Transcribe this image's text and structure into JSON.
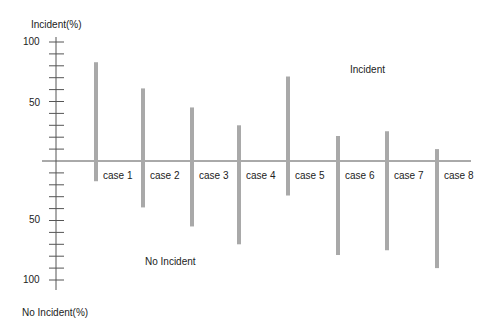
{
  "chart_data": {
    "type": "bar",
    "subtype": "diverging-vertical-lines",
    "title": "",
    "ylabel_top": "Incident(%)",
    "ylabel_bottom": "No Incident(%)",
    "region_label_top": "Incident",
    "region_label_bottom": "No Incident",
    "categories": [
      "case 1",
      "case 2",
      "case 3",
      "case 4",
      "case 5",
      "case 6",
      "case 7",
      "case 8"
    ],
    "series": [
      {
        "name": "Incident",
        "direction": "up",
        "values": [
          83,
          61,
          45,
          30,
          71,
          21,
          25,
          10
        ]
      },
      {
        "name": "No Incident",
        "direction": "down",
        "values": [
          17,
          39,
          55,
          70,
          29,
          79,
          75,
          90
        ]
      }
    ],
    "y_ticks_top": [
      "100",
      "50"
    ],
    "y_ticks_bottom": [
      "50",
      "100"
    ],
    "ylim_top": [
      0,
      100
    ],
    "ylim_bottom": [
      0,
      100
    ],
    "minor_tick_step": 10,
    "grid": false,
    "legend": "none"
  },
  "colors": {
    "bar": "#a9a9a9",
    "axis": "#555555",
    "text": "#222222"
  }
}
